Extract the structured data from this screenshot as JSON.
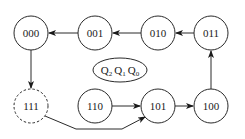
{
  "diagram": {
    "type": "state-diagram",
    "legend": {
      "vars": [
        {
          "name": "Q",
          "sub": "2"
        },
        {
          "name": "Q",
          "sub": "1"
        },
        {
          "name": "Q",
          "sub": "0"
        }
      ]
    },
    "states": [
      {
        "id": "000",
        "label": "000",
        "dashed": false
      },
      {
        "id": "001",
        "label": "001",
        "dashed": false
      },
      {
        "id": "010",
        "label": "010",
        "dashed": false
      },
      {
        "id": "011",
        "label": "011",
        "dashed": false
      },
      {
        "id": "111",
        "label": "111",
        "dashed": true
      },
      {
        "id": "110",
        "label": "110",
        "dashed": false
      },
      {
        "id": "101",
        "label": "101",
        "dashed": false
      },
      {
        "id": "100",
        "label": "100",
        "dashed": false
      }
    ],
    "transitions": [
      {
        "from": "001",
        "to": "000"
      },
      {
        "from": "010",
        "to": "001"
      },
      {
        "from": "011",
        "to": "010"
      },
      {
        "from": "100",
        "to": "011"
      },
      {
        "from": "101",
        "to": "100"
      },
      {
        "from": "110",
        "to": "101"
      },
      {
        "from": "000",
        "to": "111"
      },
      {
        "from": "111",
        "to": "101"
      }
    ],
    "colors": {
      "stroke": "#2a2a2a",
      "text": "#1a1a1a",
      "background": "#ffffff"
    }
  }
}
